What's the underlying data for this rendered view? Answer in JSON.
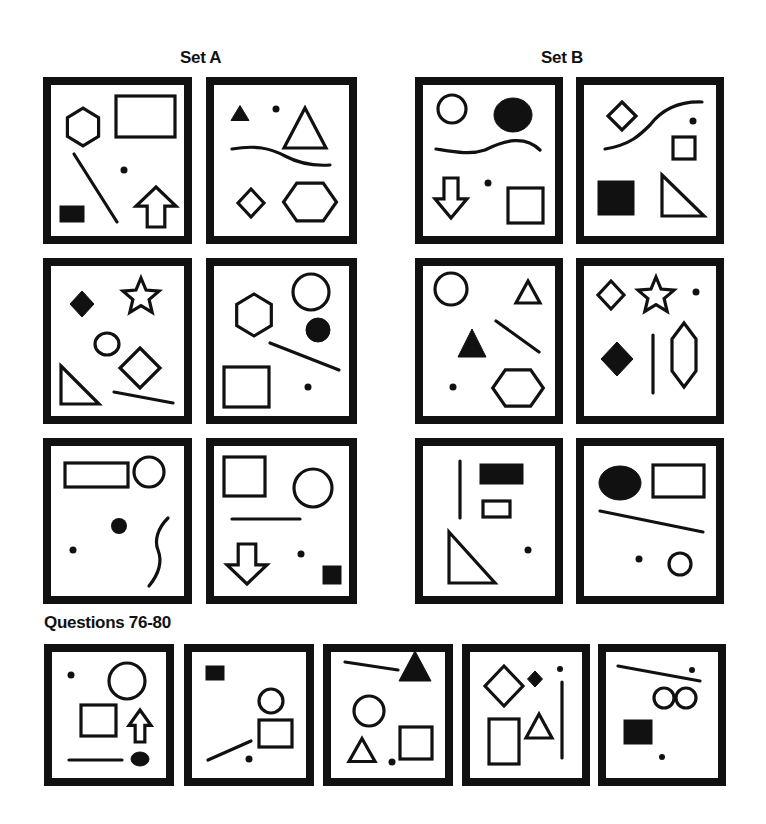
{
  "headings": {
    "set_a": "Set A",
    "set_b": "Set B",
    "questions": "Questions 76-80"
  },
  "colors": {
    "ink": "#111111",
    "background": "#ffffff"
  },
  "panels": [
    {
      "id": "set-a-1",
      "group": "Set A",
      "box": [
        43,
        77,
        149,
        167
      ],
      "shapes": [
        {
          "t": "hexagon",
          "cx": 83,
          "cy": 127,
          "r": 18,
          "fill": false,
          "vertical": true
        },
        {
          "t": "rect",
          "x": 116,
          "y": 96,
          "w": 59,
          "h": 41,
          "fill": false
        },
        {
          "t": "line",
          "x1": 74,
          "y1": 154,
          "x2": 117,
          "y2": 222
        },
        {
          "t": "dot",
          "cx": 124,
          "cy": 170,
          "r": 3.5
        },
        {
          "t": "rect",
          "x": 60,
          "y": 206,
          "w": 24,
          "h": 16,
          "fill": true
        },
        {
          "t": "arrow-up",
          "cx": 156,
          "cy": 207,
          "w": 40,
          "h": 40
        }
      ]
    },
    {
      "id": "set-a-2",
      "group": "Set A",
      "box": [
        206,
        77,
        151,
        167
      ],
      "shapes": [
        {
          "t": "triangle",
          "cx": 240,
          "cy": 113,
          "w": 18,
          "h": 15,
          "fill": true
        },
        {
          "t": "dot",
          "cx": 276,
          "cy": 109,
          "r": 3.5
        },
        {
          "t": "triangle",
          "cx": 305,
          "cy": 128,
          "w": 42,
          "h": 40,
          "fill": false
        },
        {
          "t": "curve",
          "d": "M232,149 C255,145 270,148 285,156 C300,164 315,166 330,165"
        },
        {
          "t": "diamond",
          "cx": 251,
          "cy": 203,
          "w": 26,
          "h": 28,
          "fill": false
        },
        {
          "t": "hexagon",
          "cx": 310,
          "cy": 202,
          "r": 23,
          "fill": false,
          "vertical": false
        }
      ]
    },
    {
      "id": "set-b-1",
      "group": "Set B",
      "box": [
        415,
        77,
        148,
        167
      ],
      "shapes": [
        {
          "t": "circle",
          "cx": 452,
          "cy": 109,
          "r": 14,
          "fill": false
        },
        {
          "t": "ellipse",
          "cx": 513,
          "cy": 115,
          "rx": 19,
          "ry": 17,
          "fill": true
        },
        {
          "t": "curve",
          "d": "M436,149 C455,152 470,155 485,150 C505,140 525,135 540,150"
        },
        {
          "t": "arrow-down",
          "cx": 451,
          "cy": 198,
          "w": 32,
          "h": 40
        },
        {
          "t": "dot",
          "cx": 488,
          "cy": 183,
          "r": 3.5
        },
        {
          "t": "rect",
          "x": 508,
          "y": 188,
          "w": 35,
          "h": 35,
          "fill": false
        }
      ]
    },
    {
      "id": "set-b-2",
      "group": "Set B",
      "box": [
        576,
        77,
        148,
        167
      ],
      "shapes": [
        {
          "t": "diamond",
          "cx": 622,
          "cy": 116,
          "w": 28,
          "h": 28,
          "fill": false
        },
        {
          "t": "curve",
          "d": "M605,149 C630,145 640,135 650,125 C660,112 675,101 702,102"
        },
        {
          "t": "dot",
          "cx": 693,
          "cy": 121,
          "r": 3.5
        },
        {
          "t": "rect",
          "x": 673,
          "y": 137,
          "w": 22,
          "h": 22,
          "fill": false
        },
        {
          "t": "rect",
          "x": 598,
          "y": 181,
          "w": 36,
          "h": 34,
          "fill": true
        },
        {
          "t": "right-triangle",
          "x": 662,
          "y": 175,
          "w": 42,
          "h": 41,
          "fill": false
        }
      ]
    },
    {
      "id": "set-a-3",
      "group": "Set A",
      "box": [
        43,
        258,
        149,
        166
      ],
      "shapes": [
        {
          "t": "diamond",
          "cx": 82,
          "cy": 304,
          "w": 24,
          "h": 26,
          "fill": true
        },
        {
          "t": "star",
          "cx": 141,
          "cy": 297,
          "r": 19,
          "fill": false
        },
        {
          "t": "ellipse",
          "cx": 107,
          "cy": 344,
          "rx": 12,
          "ry": 11,
          "fill": false
        },
        {
          "t": "diamond",
          "cx": 140,
          "cy": 368,
          "w": 40,
          "h": 40,
          "fill": false
        },
        {
          "t": "right-triangle",
          "x": 61,
          "y": 366,
          "w": 38,
          "h": 38,
          "fill": false
        },
        {
          "t": "line",
          "x1": 114,
          "y1": 392,
          "x2": 173,
          "y2": 403
        }
      ]
    },
    {
      "id": "set-a-4",
      "group": "Set A",
      "box": [
        206,
        258,
        151,
        166
      ],
      "shapes": [
        {
          "t": "hexagon",
          "cx": 254,
          "cy": 315,
          "r": 20,
          "fill": false,
          "vertical": true
        },
        {
          "t": "circle",
          "cx": 311,
          "cy": 292,
          "r": 18,
          "fill": false
        },
        {
          "t": "circle",
          "cx": 318,
          "cy": 330,
          "r": 12,
          "fill": true
        },
        {
          "t": "line",
          "x1": 270,
          "y1": 343,
          "x2": 339,
          "y2": 370
        },
        {
          "t": "rect",
          "x": 224,
          "y": 367,
          "w": 45,
          "h": 40,
          "fill": false
        },
        {
          "t": "dot",
          "cx": 308,
          "cy": 387,
          "r": 3.5
        }
      ]
    },
    {
      "id": "set-b-3",
      "group": "Set B",
      "box": [
        415,
        258,
        148,
        166
      ],
      "shapes": [
        {
          "t": "circle",
          "cx": 451,
          "cy": 289,
          "r": 16,
          "fill": false
        },
        {
          "t": "triangle",
          "cx": 528,
          "cy": 292,
          "w": 24,
          "h": 22,
          "fill": false
        },
        {
          "t": "triangle",
          "cx": 472,
          "cy": 343,
          "w": 28,
          "h": 28,
          "fill": true
        },
        {
          "t": "line",
          "x1": 496,
          "y1": 321,
          "x2": 539,
          "y2": 352
        },
        {
          "t": "dot",
          "cx": 453,
          "cy": 387,
          "r": 3.5
        },
        {
          "t": "hexagon",
          "cx": 518,
          "cy": 388,
          "r": 22,
          "fill": false,
          "vertical": false
        }
      ]
    },
    {
      "id": "set-b-4",
      "group": "Set B",
      "box": [
        576,
        258,
        148,
        166
      ],
      "shapes": [
        {
          "t": "diamond",
          "cx": 611,
          "cy": 295,
          "w": 26,
          "h": 28,
          "fill": false
        },
        {
          "t": "star",
          "cx": 656,
          "cy": 296,
          "r": 19,
          "fill": false
        },
        {
          "t": "dot",
          "cx": 696,
          "cy": 292,
          "r": 3.5
        },
        {
          "t": "diamond",
          "cx": 617,
          "cy": 359,
          "w": 32,
          "h": 34,
          "fill": true
        },
        {
          "t": "line",
          "x1": 653,
          "y1": 335,
          "x2": 653,
          "y2": 393
        },
        {
          "t": "long-hexagon",
          "cx": 684,
          "cy": 355,
          "w": 24,
          "h": 64,
          "fill": false
        }
      ]
    },
    {
      "id": "set-a-5",
      "group": "Set A",
      "box": [
        43,
        438,
        149,
        166
      ],
      "shapes": [
        {
          "t": "rect",
          "x": 65,
          "y": 463,
          "w": 63,
          "h": 24,
          "fill": false
        },
        {
          "t": "circle",
          "cx": 149,
          "cy": 472,
          "r": 15,
          "fill": false
        },
        {
          "t": "dot",
          "cx": 119,
          "cy": 526,
          "r": 8
        },
        {
          "t": "dot",
          "cx": 73,
          "cy": 550,
          "r": 3.5
        },
        {
          "t": "curve",
          "d": "M168,518 C158,528 154,540 158,550 C163,563 158,575 149,586"
        },
        {
          "t": "spacer"
        }
      ]
    },
    {
      "id": "set-a-6",
      "group": "Set A",
      "box": [
        206,
        438,
        151,
        166
      ],
      "shapes": [
        {
          "t": "rect",
          "x": 224,
          "y": 457,
          "w": 41,
          "h": 39,
          "fill": false
        },
        {
          "t": "circle",
          "cx": 313,
          "cy": 488,
          "r": 19,
          "fill": false
        },
        {
          "t": "line",
          "x1": 232,
          "y1": 519,
          "x2": 300,
          "y2": 519
        },
        {
          "t": "arrow-down",
          "cx": 247,
          "cy": 564,
          "w": 40,
          "h": 40
        },
        {
          "t": "dot",
          "cx": 301,
          "cy": 554,
          "r": 3.5
        },
        {
          "t": "rect",
          "x": 323,
          "y": 566,
          "w": 18,
          "h": 18,
          "fill": true
        }
      ]
    },
    {
      "id": "set-b-5",
      "group": "Set B",
      "box": [
        415,
        438,
        148,
        166
      ],
      "shapes": [
        {
          "t": "line",
          "x1": 460,
          "y1": 461,
          "x2": 460,
          "y2": 518
        },
        {
          "t": "rect",
          "x": 480,
          "y": 464,
          "w": 43,
          "h": 20,
          "fill": true
        },
        {
          "t": "rect",
          "x": 483,
          "y": 501,
          "w": 27,
          "h": 16,
          "fill": false
        },
        {
          "t": "right-triangle",
          "x": 449,
          "y": 532,
          "w": 46,
          "h": 51,
          "fill": false
        },
        {
          "t": "dot",
          "cx": 528,
          "cy": 550,
          "r": 3.5
        },
        {
          "t": "spacer"
        }
      ]
    },
    {
      "id": "set-b-6",
      "group": "Set B",
      "box": [
        576,
        438,
        148,
        166
      ],
      "shapes": [
        {
          "t": "ellipse",
          "cx": 620,
          "cy": 483,
          "rx": 21,
          "ry": 17,
          "fill": true
        },
        {
          "t": "rect",
          "x": 653,
          "y": 465,
          "w": 51,
          "h": 32,
          "fill": false
        },
        {
          "t": "line",
          "x1": 600,
          "y1": 511,
          "x2": 703,
          "y2": 532
        },
        {
          "t": "dot",
          "cx": 639,
          "cy": 559,
          "r": 3.5
        },
        {
          "t": "circle",
          "cx": 680,
          "cy": 564,
          "r": 11,
          "fill": false
        },
        {
          "t": "spacer"
        }
      ]
    },
    {
      "id": "question-76",
      "group": "Questions",
      "box": [
        44,
        644,
        130,
        142
      ],
      "shapes": [
        {
          "t": "dot",
          "cx": 71,
          "cy": 675,
          "r": 3.5
        },
        {
          "t": "circle",
          "cx": 127,
          "cy": 681,
          "r": 18,
          "fill": false
        },
        {
          "t": "rect",
          "x": 81,
          "y": 705,
          "w": 35,
          "h": 31,
          "fill": false
        },
        {
          "t": "arrow-up",
          "cx": 140,
          "cy": 726,
          "w": 22,
          "h": 32
        },
        {
          "t": "line",
          "x1": 69,
          "y1": 760,
          "x2": 122,
          "y2": 760
        },
        {
          "t": "ellipse",
          "cx": 140,
          "cy": 759,
          "rx": 9,
          "ry": 7,
          "fill": true
        }
      ]
    },
    {
      "id": "question-77",
      "group": "Questions",
      "box": [
        184,
        644,
        130,
        142
      ],
      "shapes": [
        {
          "t": "rect",
          "x": 206,
          "y": 666,
          "w": 18,
          "h": 14,
          "fill": true
        },
        {
          "t": "circle",
          "cx": 271,
          "cy": 701,
          "r": 12,
          "fill": false
        },
        {
          "t": "rect",
          "x": 259,
          "y": 720,
          "w": 33,
          "h": 27,
          "fill": false
        },
        {
          "t": "line",
          "x1": 208,
          "y1": 760,
          "x2": 251,
          "y2": 741
        },
        {
          "t": "dot",
          "cx": 249,
          "cy": 759,
          "r": 3.5
        },
        {
          "t": "spacer"
        }
      ]
    },
    {
      "id": "question-78",
      "group": "Questions",
      "box": [
        323,
        644,
        130,
        142
      ],
      "shapes": [
        {
          "t": "line",
          "x1": 345,
          "y1": 662,
          "x2": 398,
          "y2": 670
        },
        {
          "t": "triangle",
          "cx": 415,
          "cy": 666,
          "w": 32,
          "h": 30,
          "fill": true
        },
        {
          "t": "circle",
          "cx": 369,
          "cy": 711,
          "r": 15,
          "fill": false
        },
        {
          "t": "triangle",
          "cx": 362,
          "cy": 750,
          "w": 26,
          "h": 23,
          "fill": false
        },
        {
          "t": "dot",
          "cx": 392,
          "cy": 762,
          "r": 3.5
        },
        {
          "t": "rect",
          "x": 400,
          "y": 727,
          "w": 32,
          "h": 32,
          "fill": false
        }
      ]
    },
    {
      "id": "question-79",
      "group": "Questions",
      "box": [
        462,
        644,
        128,
        142
      ],
      "shapes": [
        {
          "t": "diamond",
          "cx": 504,
          "cy": 686,
          "w": 38,
          "h": 40,
          "fill": false
        },
        {
          "t": "diamond",
          "cx": 535,
          "cy": 679,
          "w": 15,
          "h": 16,
          "fill": true
        },
        {
          "t": "dot",
          "cx": 560,
          "cy": 669,
          "r": 3
        },
        {
          "t": "line",
          "x1": 562,
          "y1": 682,
          "x2": 562,
          "y2": 758
        },
        {
          "t": "rect",
          "x": 489,
          "y": 719,
          "w": 30,
          "h": 45,
          "fill": false
        },
        {
          "t": "triangle",
          "cx": 539,
          "cy": 726,
          "w": 26,
          "h": 24,
          "fill": false
        }
      ]
    },
    {
      "id": "question-80",
      "group": "Questions",
      "box": [
        598,
        644,
        128,
        142
      ],
      "shapes": [
        {
          "t": "line",
          "x1": 618,
          "y1": 666,
          "x2": 700,
          "y2": 681
        },
        {
          "t": "dot",
          "cx": 692,
          "cy": 670,
          "r": 3
        },
        {
          "t": "circle",
          "cx": 664,
          "cy": 698,
          "r": 10,
          "fill": false
        },
        {
          "t": "circle",
          "cx": 686,
          "cy": 698,
          "r": 10,
          "fill": false
        },
        {
          "t": "rect",
          "x": 624,
          "y": 720,
          "w": 28,
          "h": 24,
          "fill": true
        },
        {
          "t": "dot",
          "cx": 662,
          "cy": 757,
          "r": 3
        }
      ]
    }
  ]
}
